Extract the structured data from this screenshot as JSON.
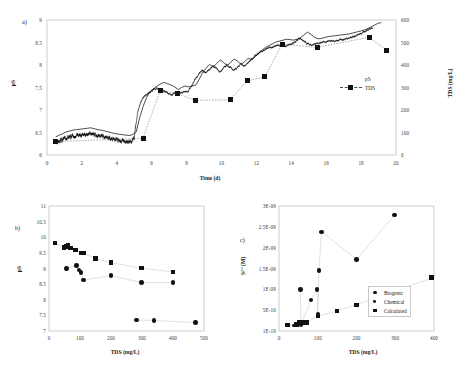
{
  "figure": {
    "panels": [
      "a)",
      "b)",
      "c)"
    ]
  },
  "chart_data": [
    {
      "id": "panel-a",
      "panel_label": "a)",
      "type": "line",
      "title": "",
      "xlabel": "Time (d)",
      "ylabel": "pS",
      "y2label": "TDS (mg/L)",
      "xlim": [
        0,
        20
      ],
      "xticks": [
        0,
        2,
        4,
        6,
        8,
        10,
        12,
        14,
        16,
        18,
        20
      ],
      "ylim": [
        6,
        9
      ],
      "yticks": [
        6,
        6.5,
        7,
        7.5,
        8,
        8.5,
        9
      ],
      "y_inverted": true,
      "y2lim": [
        0,
        600
      ],
      "y2ticks": [
        0,
        100,
        200,
        300,
        400,
        500,
        600
      ],
      "grid": false,
      "legend_position": "right",
      "legend": [
        "pS",
        "TDS"
      ],
      "series": [
        {
          "name": "pS",
          "axis": "left",
          "style": "continuous-noisy-line",
          "x": [
            0.5,
            0.7,
            0.9,
            1.1,
            1.3,
            1.5,
            1.7,
            1.9,
            2.1,
            2.3,
            2.5,
            2.7,
            2.9,
            3.1,
            3.3,
            3.5,
            3.7,
            3.9,
            4.1,
            4.3,
            4.5,
            4.7,
            4.9,
            5.0,
            5.1,
            5.2,
            5.35,
            5.5,
            5.7,
            5.9,
            6.1,
            6.3,
            6.5,
            6.7,
            6.9,
            7.1,
            7.3,
            7.5,
            7.7,
            7.9,
            8.1,
            8.3,
            8.5,
            8.7,
            8.9,
            9.1,
            9.3,
            9.5,
            9.7,
            9.9,
            10.1,
            10.3,
            10.5,
            10.7,
            10.9,
            11.1,
            11.3,
            11.5,
            11.7,
            11.9,
            12.1,
            12.3,
            12.5,
            12.7,
            12.9,
            13.1,
            13.3,
            13.5,
            13.7,
            13.9,
            14.1,
            14.3,
            14.5,
            14.7,
            14.9,
            15.1,
            15.3,
            15.5,
            15.7,
            15.9,
            16.1,
            16.3,
            16.5,
            16.7,
            16.9,
            17.1,
            17.3,
            17.5,
            17.7,
            17.9,
            18.1,
            18.3,
            18.5,
            18.7
          ],
          "y": [
            8.72,
            8.68,
            8.66,
            8.62,
            8.6,
            8.58,
            8.57,
            8.56,
            8.55,
            8.54,
            8.53,
            8.55,
            8.57,
            8.58,
            8.6,
            8.62,
            8.64,
            8.66,
            8.67,
            8.68,
            8.69,
            8.7,
            8.68,
            8.62,
            8.3,
            8.05,
            7.85,
            7.72,
            7.66,
            7.6,
            7.55,
            7.52,
            7.55,
            7.58,
            7.62,
            7.68,
            7.63,
            7.6,
            7.62,
            7.6,
            7.58,
            7.45,
            7.3,
            7.2,
            7.12,
            7.18,
            7.1,
            7.02,
            7.08,
            7.15,
            7.07,
            7.0,
            7.05,
            7.12,
            7.06,
            6.98,
            7.02,
            6.95,
            6.88,
            6.8,
            6.74,
            6.7,
            6.66,
            6.62,
            6.6,
            6.58,
            6.56,
            6.57,
            6.58,
            6.56,
            6.52,
            6.46,
            6.4,
            6.46,
            6.52,
            6.55,
            6.54,
            6.52,
            6.5,
            6.49,
            6.48,
            6.47,
            6.46,
            6.45,
            6.44,
            6.42,
            6.4,
            6.38,
            6.35,
            6.32,
            6.28,
            6.24,
            6.2,
            6.18
          ],
          "noise_amplitude": 0.05
        },
        {
          "name": "TDS",
          "axis": "right",
          "style": "dotted-with-square-markers",
          "x": [
            0,
            5,
            6,
            7,
            8,
            10,
            11,
            12,
            13,
            15,
            18,
            19
          ],
          "y": [
            95,
            110,
            288,
            272,
            243,
            245,
            330,
            347,
            492,
            478,
            523,
            465
          ]
        }
      ]
    },
    {
      "id": "panel-b",
      "panel_label": "b)",
      "type": "scatter",
      "title": "",
      "xlabel": "TDS (mg/L)",
      "ylabel": "pS",
      "xlim": [
        0,
        500
      ],
      "xticks": [
        0,
        100,
        200,
        300,
        400,
        500
      ],
      "ylim": [
        7,
        11
      ],
      "yticks": [
        7,
        7.5,
        8,
        8.5,
        9,
        9.5,
        10,
        10.5,
        11
      ],
      "y_inverted": true,
      "grid": false,
      "legend_position": "none",
      "series": [
        {
          "name": "upper-square-series",
          "marker": "square",
          "x": [
            20,
            48,
            55,
            62,
            70,
            85,
            103,
            112,
            150,
            200,
            298,
            400
          ],
          "y": [
            9.82,
            9.68,
            9.72,
            9.76,
            9.67,
            9.6,
            9.5,
            9.5,
            9.33,
            9.2,
            9.02,
            8.9
          ]
        },
        {
          "name": "middle-circle-series",
          "marker": "circle",
          "x": [
            56,
            88,
            96,
            104,
            112,
            200,
            298,
            400
          ],
          "y": [
            9.0,
            9.1,
            8.95,
            8.87,
            8.63,
            8.77,
            8.55,
            8.55
          ]
        },
        {
          "name": "lower-circle-series",
          "marker": "circle",
          "x": [
            283,
            338,
            472
          ],
          "y": [
            7.8,
            7.79,
            7.72
          ]
        }
      ]
    },
    {
      "id": "panel-c",
      "panel_label": "c)",
      "type": "scatter",
      "title": "",
      "xlabel": "TDS (mg/L)",
      "ylabel": "S2- (M)",
      "ylabel_display": "S²⁻ (M)",
      "xlim": [
        0,
        400
      ],
      "xticks": [
        0,
        100,
        200,
        300,
        400
      ],
      "ylim": [
        0,
        3e-09
      ],
      "yticks": [
        0,
        5e-10,
        1e-09,
        1.5e-09,
        2e-09,
        2.5e-09,
        3e-09
      ],
      "ytick_labels": [
        "1E-19",
        "5E-10",
        "1E-09",
        "1.5E-09",
        "2E-09",
        "2.5E-09",
        "3E-09"
      ],
      "grid": false,
      "legend_position": "inside-right",
      "legend": [
        "Biogenic",
        "Chemical",
        "Calculated"
      ],
      "series": [
        {
          "name": "Biogenic",
          "marker": "circle",
          "x": [
            55,
            57,
            83,
            98,
            100,
            103,
            110,
            200,
            298
          ],
          "y": [
            1e-09,
            1.6e-10,
            7.5e-10,
            1e-09,
            4e-10,
            1.45e-09,
            2.38e-09,
            1.72e-09,
            2.78e-09
          ]
        },
        {
          "name": "Chemical",
          "marker": "circle-small",
          "x": [
            40,
            50,
            58,
            70
          ],
          "y": [
            1.4e-10,
            1.6e-10,
            2.1e-10,
            2e-10
          ]
        },
        {
          "name": "Calculated",
          "marker": "square",
          "x": [
            22,
            45,
            52,
            62,
            72,
            100,
            150,
            200,
            298,
            400
          ],
          "y": [
            8e-11,
            1.2e-10,
            1.5e-10,
            1.8e-10,
            2e-10,
            3.6e-10,
            4.8e-10,
            6.3e-10,
            9.7e-10,
            1.28e-09
          ]
        }
      ]
    }
  ]
}
